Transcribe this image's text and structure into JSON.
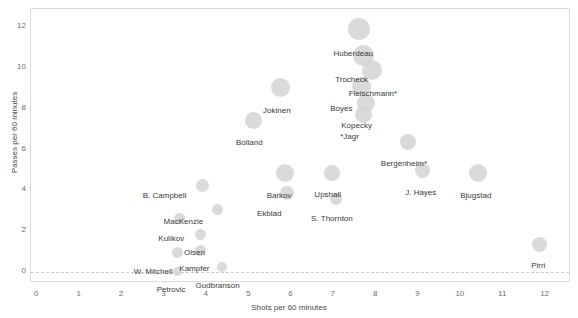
{
  "chart_data": {
    "type": "scatter",
    "title": "",
    "subtitle": "",
    "xlabel": "Shots per 60 minutes",
    "ylabel": "Passes per 60 minutes",
    "xlim": [
      -0.15,
      12.6
    ],
    "ylim": [
      -0.55,
      12.9
    ],
    "xticks": [
      0,
      1,
      2,
      3,
      4,
      5,
      6,
      7,
      8,
      9,
      10,
      11,
      12
    ],
    "xtick_labels": [
      "0",
      "1",
      "2",
      "3",
      "4",
      "5",
      "6",
      "7",
      "8",
      "9",
      "10",
      "11",
      "12"
    ],
    "yticks": [
      0,
      2,
      4,
      6,
      8,
      10,
      12
    ],
    "ytick_labels": [
      "0",
      "2",
      "4",
      "6",
      "8",
      "10",
      "12"
    ],
    "grid": false,
    "legend": "none",
    "reference_line": {
      "axis": "y",
      "value": 0,
      "style": "dotted",
      "color": "#cccccc"
    },
    "marker": {
      "shape": "circle",
      "color": "#d3d3d3",
      "opacity": 0.85,
      "size_encodes": "time on ice"
    },
    "points": [
      {
        "label": "Huberdeau",
        "x": 7.6,
        "y": 11.9,
        "r": 11.0,
        "label_dx": -6,
        "label_dy": 21
      },
      {
        "label": "Trocheck",
        "x": 7.7,
        "y": 10.6,
        "r": 10.5,
        "label_dx": -12,
        "label_dy": 20
      },
      {
        "label": "Fleischmann*",
        "x": 7.9,
        "y": 9.9,
        "r": 10.0,
        "label_dx": 1,
        "label_dy": 20
      },
      {
        "label": "Boyes",
        "x": 7.65,
        "y": 9.1,
        "r": 9.5,
        "label_dx": -20,
        "label_dy": 19
      },
      {
        "label": "Kopecky",
        "x": 7.75,
        "y": 8.3,
        "r": 9.0,
        "label_dx": -9,
        "label_dy": 19
      },
      {
        "label": "*Jagr",
        "x": 7.7,
        "y": 7.7,
        "r": 8.5,
        "label_dx": -14,
        "label_dy": 18
      },
      {
        "label": "Jokinen",
        "x": 5.75,
        "y": 9.05,
        "r": 9.5,
        "label_dx": -4,
        "label_dy": 20
      },
      {
        "label": "Bolland",
        "x": 5.1,
        "y": 7.45,
        "r": 8.5,
        "label_dx": -4,
        "label_dy": 19
      },
      {
        "label": "Bergenheim*",
        "x": 8.75,
        "y": 6.35,
        "r": 8.0,
        "label_dx": -4,
        "label_dy": 18
      },
      {
        "label": "J. Hayes",
        "x": 9.1,
        "y": 4.95,
        "r": 7.5,
        "label_dx": -2,
        "label_dy": 18
      },
      {
        "label": "Bjugstad",
        "x": 10.4,
        "y": 4.85,
        "r": 9.0,
        "label_dx": -2,
        "label_dy": 19
      },
      {
        "label": "Pirri",
        "x": 11.85,
        "y": 1.35,
        "r": 7.5,
        "label_dx": -1,
        "label_dy": 18
      },
      {
        "label": "Barkov",
        "x": 5.85,
        "y": 4.85,
        "r": 9.0,
        "label_dx": -6,
        "label_dy": 19
      },
      {
        "label": "Ekblad",
        "x": 5.9,
        "y": 3.85,
        "r": 7.0,
        "label_dx": -18,
        "label_dy": 17
      },
      {
        "label": "Upshall",
        "x": 6.95,
        "y": 4.85,
        "r": 8.0,
        "label_dx": -4,
        "label_dy": 18
      },
      {
        "label": "S. Thornton",
        "x": 7.05,
        "y": 3.55,
        "r": 6.0,
        "label_dx": -4,
        "label_dy": 16
      },
      {
        "label": "B. Campbell",
        "x": 3.9,
        "y": 4.25,
        "r": 6.5,
        "label_dx": -38,
        "label_dy": 7
      },
      {
        "label": "MacKenzie",
        "x": 4.25,
        "y": 3.05,
        "r": 5.5,
        "label_dx": -34,
        "label_dy": 8
      },
      {
        "label": "Kulikov",
        "x": 3.35,
        "y": 2.6,
        "r": 5.5,
        "label_dx": -8,
        "label_dy": 16
      },
      {
        "label": "Olsen",
        "x": 3.85,
        "y": 1.85,
        "r": 5.5,
        "label_dx": -6,
        "label_dy": 15
      },
      {
        "label": "Kampfer",
        "x": 3.85,
        "y": 1.05,
        "r": 5.5,
        "label_dx": -6,
        "label_dy": 15
      },
      {
        "label": "W. Mitchell",
        "x": 3.3,
        "y": 0.95,
        "r": 5.5,
        "label_dx": -24,
        "label_dy": 16
      },
      {
        "label": "Petrovic",
        "x": 3.3,
        "y": 0.0,
        "r": 4.5,
        "label_dx": -6,
        "label_dy": 14
      },
      {
        "label": "Gudbranson",
        "x": 4.35,
        "y": 0.25,
        "r": 5.0,
        "label_dx": -4,
        "label_dy": 15
      }
    ]
  },
  "axes": {
    "x_title": "Shots per 60 minutes",
    "y_title": "Passes per 60 minutes"
  }
}
